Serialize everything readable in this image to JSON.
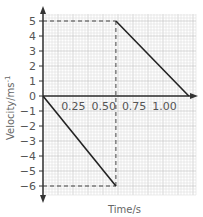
{
  "chart_data": {
    "type": "line",
    "title": "",
    "xlabel": "Time/s",
    "ylabel": "Velocity/ms",
    "ylabel_superscript": "-1",
    "xlim": [
      0,
      1.25
    ],
    "ylim": [
      -6.5,
      5.5
    ],
    "x_ticks": [
      0.25,
      0.5,
      0.75,
      1.0
    ],
    "x_tick_labels": [
      "0.25",
      "0.50",
      "0.75",
      "1.00"
    ],
    "y_ticks": [
      5,
      4,
      3,
      2,
      1,
      0,
      -1,
      -2,
      -3,
      -4,
      -5,
      -6
    ],
    "y_tick_labels": [
      "5",
      "4",
      "3",
      "2",
      "1",
      "0",
      "−1",
      "−2",
      "−3",
      "−4",
      "−5",
      "−6"
    ],
    "grid": true,
    "series": [
      {
        "name": "velocity-segment-1",
        "x": [
          0,
          0.6
        ],
        "y": [
          0,
          -6
        ]
      },
      {
        "name": "velocity-segment-2",
        "x": [
          0.6,
          1.2
        ],
        "y": [
          5,
          0
        ]
      }
    ],
    "reference_lines": [
      {
        "name": "dashed-vertical-0.6",
        "x": [
          0.6,
          0.6
        ],
        "y": [
          -6,
          5
        ]
      },
      {
        "name": "dashed-horizontal-5",
        "x": [
          0,
          0.6
        ],
        "y": [
          5,
          5
        ]
      },
      {
        "name": "dashed-horizontal-neg6",
        "x": [
          0,
          0.6
        ],
        "y": [
          -6,
          -6
        ]
      }
    ],
    "colors": {
      "line": "#222222",
      "grid_major": "#bdbdbd",
      "grid_minor": "#dedede",
      "axis": "#333333",
      "dash": "#444444"
    }
  }
}
